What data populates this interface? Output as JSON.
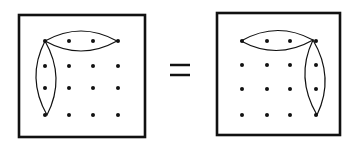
{
  "diagram": {
    "relation_symbol": "=",
    "ink_color": "#111111",
    "background": "#ffffff",
    "panels": [
      {
        "name": "left-panel",
        "frame": {
          "x": 19,
          "y": 15,
          "w": 126,
          "h": 122
        },
        "grid": {
          "cols": [
            45,
            69,
            93,
            118
          ],
          "rows": [
            41,
            66,
            88,
            115
          ]
        },
        "loops": [
          {
            "name": "top-row-loop",
            "from": [
              45,
              41
            ],
            "to": [
              117,
              41
            ],
            "orientation": "horizontal"
          },
          {
            "name": "left-column-loop",
            "from": [
              45,
              41
            ],
            "to": [
              47,
              115
            ],
            "orientation": "vertical"
          }
        ]
      },
      {
        "name": "right-panel",
        "frame": {
          "x": 217,
          "y": 13,
          "w": 123,
          "h": 122
        },
        "grid": {
          "cols": [
            242,
            267,
            290,
            316
          ],
          "rows": [
            41,
            65,
            89,
            115
          ]
        },
        "loops": [
          {
            "name": "top-row-loop",
            "from": [
              241,
              41
            ],
            "to": [
              313,
              40
            ],
            "orientation": "horizontal"
          },
          {
            "name": "right-column-loop",
            "from": [
              313,
              40
            ],
            "to": [
              317,
              115
            ],
            "orientation": "vertical"
          }
        ]
      }
    ]
  }
}
